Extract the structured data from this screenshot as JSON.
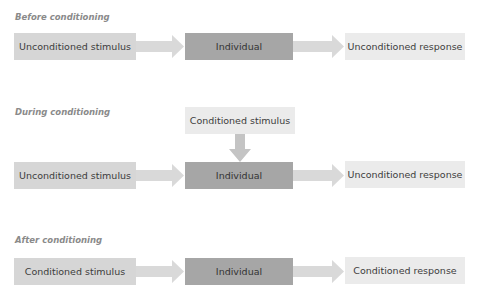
{
  "sections": [
    {
      "title": "Before conditioning",
      "left": "Unconditioned stimulus",
      "middle": "Individual",
      "right": "Unconditioned response"
    },
    {
      "title": "During conditioning",
      "top": "Conditioned stimulus",
      "left": "Unconditioned stimulus",
      "middle": "Individual",
      "right": "Unconditioned response"
    },
    {
      "title": "After conditioning",
      "left": "Conditioned stimulus",
      "middle": "Individual",
      "right": "Conditioned response"
    }
  ],
  "colors": {
    "stimulus_box": "#d6d6d6",
    "individual_box": "#a6a6a6",
    "response_box": "#ebebeb",
    "arrow": "#d9d9d9",
    "title": "#8a8a8a"
  }
}
